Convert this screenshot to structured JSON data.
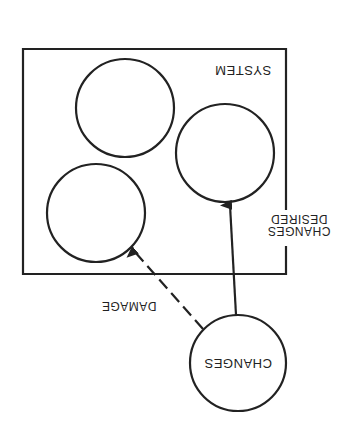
{
  "diagram": {
    "orientation": "rotated 180 degrees",
    "system_box": {
      "label": "SYSTEM"
    },
    "components": [
      {
        "id": "component-top"
      },
      {
        "id": "component-right"
      },
      {
        "id": "component-bottom-left"
      }
    ],
    "external_node": {
      "label": "CHANGES"
    },
    "arrows": [
      {
        "from": "CHANGES",
        "to": "component-right",
        "style": "solid",
        "label_line1": "DESIRED",
        "label_line2": "CHANGES"
      },
      {
        "from": "CHANGES",
        "to": "component-bottom-left",
        "style": "dashed",
        "label": "DAMAGE"
      }
    ],
    "colors": {
      "stroke": "#222222",
      "background": "#ffffff"
    }
  }
}
